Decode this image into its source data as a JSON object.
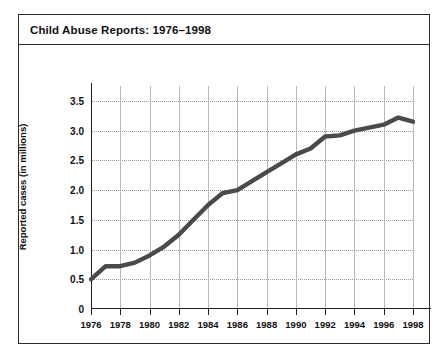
{
  "figure": {
    "title": "Child Abuse Reports: 1976–1998",
    "border_color": "#2b2b2b",
    "background": "#ffffff"
  },
  "chart_data": {
    "type": "line",
    "title": "Child Abuse Reports: 1976–1998",
    "xlabel": "",
    "ylabel": "Reported cases (in millions)",
    "xlim": [
      1976,
      1998
    ],
    "ylim": [
      0,
      3.75
    ],
    "grid": "dotted horizontal gridlines and solid vertical gridlines",
    "legend": "none",
    "line_color": "#4a4a4a",
    "x": [
      1976,
      1977,
      1978,
      1979,
      1980,
      1981,
      1982,
      1983,
      1984,
      1985,
      1986,
      1987,
      1988,
      1989,
      1990,
      1991,
      1992,
      1993,
      1994,
      1995,
      1996,
      1997,
      1998
    ],
    "values": [
      0.5,
      0.72,
      0.72,
      0.78,
      0.9,
      1.05,
      1.25,
      1.5,
      1.75,
      1.95,
      2.0,
      2.15,
      2.3,
      2.45,
      2.6,
      2.7,
      2.9,
      2.92,
      3.0,
      3.05,
      3.1,
      3.22,
      3.15
    ],
    "ytick_values": [
      0,
      0.5,
      1.0,
      1.5,
      2.0,
      2.5,
      3.0,
      3.5
    ],
    "ytick_labels": [
      "0",
      "0.5",
      "1.0",
      "1.5",
      "2.0",
      "2.5",
      "3.0",
      "3.5"
    ],
    "xtick_values": [
      1976,
      1978,
      1980,
      1982,
      1984,
      1986,
      1988,
      1990,
      1992,
      1994,
      1996,
      1998
    ],
    "xtick_labels": [
      "1976",
      "1978",
      "1980",
      "1982",
      "1984",
      "1986",
      "1988",
      "1990",
      "1992",
      "1994",
      "1996",
      "1998"
    ]
  }
}
